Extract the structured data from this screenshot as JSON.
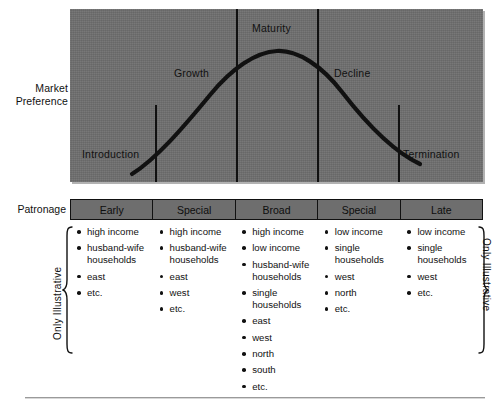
{
  "figure": {
    "chart": {
      "axis_label_lines": [
        "Market",
        "Preference"
      ],
      "stages": [
        {
          "name": "Introduction"
        },
        {
          "name": "Growth"
        },
        {
          "name": "Maturity"
        },
        {
          "name": "Decline"
        },
        {
          "name": "Termination"
        }
      ],
      "panel_color": "#6e6e6e",
      "curve_color": "#111111"
    },
    "table": {
      "row_label": "Patronage",
      "headers": [
        "Early",
        "Special",
        "Broad",
        "Special",
        "Late"
      ],
      "columns": [
        [
          "high income",
          "husband-wife households",
          "east",
          "etc."
        ],
        [
          "high income",
          "husband-wife households",
          "east",
          "west",
          "etc."
        ],
        [
          "high income",
          "low income",
          "husband-wife households",
          "single households",
          "east",
          "west",
          "north",
          "south",
          "etc."
        ],
        [
          "low income",
          "single households",
          "west",
          "north",
          "etc."
        ],
        [
          "low income",
          "single households",
          "west",
          "etc."
        ]
      ],
      "note_left": "Only Illustrative",
      "note_right": "Only Illustrative"
    }
  },
  "chart_data": {
    "type": "line",
    "title": "",
    "xlabel": "",
    "ylabel": "Market Preference",
    "xlim": [
      0,
      100
    ],
    "ylim": [
      0,
      100
    ],
    "grid": false,
    "legend": null,
    "annotations": [
      {
        "text": "Introduction",
        "x": 10,
        "y": 16
      },
      {
        "text": "Growth",
        "x": 30,
        "y": 66
      },
      {
        "text": "Maturity",
        "x": 50,
        "y": 95
      },
      {
        "text": "Decline",
        "x": 72,
        "y": 66
      },
      {
        "text": "Termination",
        "x": 92,
        "y": 16
      }
    ],
    "stage_boundaries": [
      21,
      40,
      60,
      80
    ],
    "series": [
      {
        "name": "Market preference life cycle",
        "x": [
          8,
          14,
          21,
          28,
          35,
          42,
          50,
          58,
          65,
          72,
          79,
          86,
          92
        ],
        "y": [
          4,
          14,
          26,
          42,
          57,
          68,
          73,
          70,
          61,
          46,
          30,
          17,
          11
        ]
      }
    ]
  }
}
